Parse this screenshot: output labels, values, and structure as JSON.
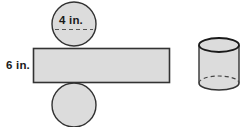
{
  "figure": {
    "background_color": "#ffffff",
    "shape_fill_color": "#dcdcdc",
    "shape_stroke_color": "#333333",
    "label_color": "#1a1a1a",
    "labels": {
      "diameter": "4 in.",
      "height": "6 in."
    },
    "net": {
      "name": "cylinder-net",
      "top_circle": {
        "name": "top-circle",
        "cx": 74,
        "cy": 24,
        "r": 22
      },
      "bottom_circle": {
        "name": "bottom-circle",
        "cx": 74,
        "cy": 105,
        "r": 22
      },
      "rectangle": {
        "name": "lateral-rectangle",
        "x": 33,
        "y": 48,
        "width": 136,
        "height": 34
      },
      "diameter_line": {
        "name": "diameter-dashed-line",
        "x1": 55,
        "y1": 29,
        "x2": 93,
        "y2": 29
      }
    },
    "solid": {
      "name": "solid-cylinder",
      "cx": 219,
      "top_cy": 45,
      "bottom_cy": 83,
      "rx": 20,
      "ry": 7
    }
  }
}
